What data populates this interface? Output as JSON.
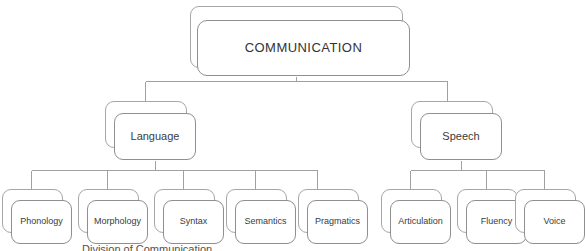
{
  "diagram": {
    "type": "hierarchy-tree",
    "orientation": "top-down",
    "title": "",
    "line_color": "#a0a0a0",
    "box_border_color": "#8f8f8f",
    "box_fill_color": "#ffffff",
    "text_color": "#3b3b3b",
    "background_color": "#ffffff",
    "node_style": "stacked-rounded-rectangle"
  },
  "nodes": {
    "root": {
      "label": "COMMUNICATION",
      "level": 1
    },
    "level2": [
      {
        "id": "language",
        "label": "Language",
        "level": 2
      },
      {
        "id": "speech",
        "label": "Speech",
        "level": 2
      }
    ],
    "level3_language": [
      {
        "id": "phonology",
        "label": "Phonology",
        "level": 3
      },
      {
        "id": "morphology",
        "label": "Morphology",
        "level": 3
      },
      {
        "id": "syntax",
        "label": "Syntax",
        "level": 3
      },
      {
        "id": "semantics",
        "label": "Semantics",
        "level": 3
      },
      {
        "id": "pragmatics",
        "label": "Pragmatics",
        "level": 3
      }
    ],
    "level3_speech": [
      {
        "id": "articulation",
        "label": "Articulation",
        "level": 3
      },
      {
        "id": "fluency",
        "label": "Fluency",
        "level": 3
      },
      {
        "id": "voice",
        "label": "Voice",
        "level": 3
      }
    ]
  },
  "caption": {
    "text": "Division of Communication"
  }
}
